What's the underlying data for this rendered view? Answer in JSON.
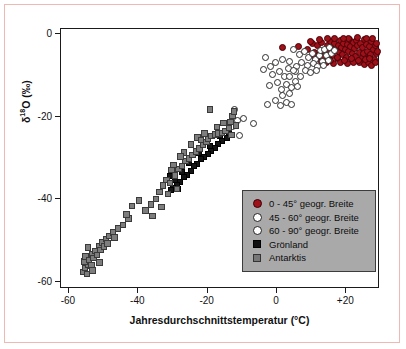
{
  "chart_data": {
    "type": "scatter",
    "title": "",
    "xlabel": "Jahresdurchschnittstemperatur (°C)",
    "ylabel": "δ¹⁸O (‰)",
    "xlim": [
      -62,
      30
    ],
    "ylim": [
      -62,
      1
    ],
    "xticks": [
      -60,
      -40,
      -20,
      0,
      20
    ],
    "xticklabels": [
      "-60",
      "-40",
      "-20",
      "0",
      "+20"
    ],
    "yticks": [
      0,
      -20,
      -40,
      -60
    ],
    "yticklabels": [
      "0",
      "-20",
      "-40",
      "-60"
    ],
    "grid": false,
    "legend_position": "lower-right-inside",
    "series": [
      {
        "name": "0 - 45° geogr. Breite",
        "marker": "filled-circle",
        "color": "#9e1119",
        "points": [
          [
            2.0,
            -3.4
          ],
          [
            6.5,
            -3.2
          ],
          [
            9.0,
            -4.0
          ],
          [
            10.5,
            -2.6
          ],
          [
            11.2,
            -4.6
          ],
          [
            12.0,
            -3.0
          ],
          [
            12.6,
            -5.2
          ],
          [
            13.2,
            -2.2
          ],
          [
            13.8,
            -4.2
          ],
          [
            14.2,
            -6.0
          ],
          [
            14.8,
            -3.0
          ],
          [
            15.2,
            -4.8
          ],
          [
            15.6,
            -2.0
          ],
          [
            16.0,
            -3.8
          ],
          [
            16.4,
            -5.4
          ],
          [
            16.8,
            -2.6
          ],
          [
            17.2,
            -4.2
          ],
          [
            17.6,
            -6.2
          ],
          [
            18.0,
            -3.0
          ],
          [
            18.3,
            -4.8
          ],
          [
            18.6,
            -1.8
          ],
          [
            19.0,
            -3.4
          ],
          [
            19.3,
            -5.2
          ],
          [
            19.6,
            -2.4
          ],
          [
            20.0,
            -4.0
          ],
          [
            20.3,
            -6.0
          ],
          [
            20.6,
            -2.8
          ],
          [
            21.0,
            -4.4
          ],
          [
            21.3,
            -1.6
          ],
          [
            21.6,
            -3.2
          ],
          [
            22.0,
            -5.0
          ],
          [
            22.3,
            -2.2
          ],
          [
            22.6,
            -3.8
          ],
          [
            23.0,
            -5.6
          ],
          [
            23.3,
            -1.8
          ],
          [
            23.6,
            -3.0
          ],
          [
            24.0,
            -4.6
          ],
          [
            24.3,
            -2.4
          ],
          [
            24.6,
            -6.2
          ],
          [
            25.0,
            -3.4
          ],
          [
            25.3,
            -5.0
          ],
          [
            25.6,
            -1.6
          ],
          [
            26.0,
            -2.8
          ],
          [
            26.3,
            -4.4
          ],
          [
            26.6,
            -6.0
          ],
          [
            27.0,
            -3.2
          ],
          [
            27.3,
            -5.2
          ],
          [
            27.6,
            -2.0
          ],
          [
            28.0,
            -4.0
          ],
          [
            28.3,
            -6.4
          ],
          [
            28.6,
            -3.0
          ],
          [
            28.9,
            -5.0
          ],
          [
            24.0,
            -7.2
          ],
          [
            25.5,
            -7.6
          ],
          [
            26.8,
            -7.0
          ],
          [
            27.5,
            -7.8
          ],
          [
            22.5,
            -7.0
          ],
          [
            20.5,
            -7.4
          ],
          [
            18.5,
            -7.2
          ],
          [
            16.5,
            -7.4
          ],
          [
            14.5,
            -7.0
          ],
          [
            13.0,
            -6.8
          ],
          [
            11.5,
            -6.4
          ],
          [
            21.0,
            -1.2
          ],
          [
            23.5,
            -1.0
          ],
          [
            26.0,
            -1.2
          ],
          [
            27.8,
            -1.4
          ],
          [
            19.5,
            -1.2
          ],
          [
            17.0,
            -1.4
          ],
          [
            15.0,
            -1.2
          ],
          [
            12.5,
            -1.6
          ],
          [
            29.2,
            -4.4
          ],
          [
            29.0,
            -2.4
          ],
          [
            28.8,
            -7.0
          ],
          [
            10.0,
            -2.0
          ],
          [
            11.0,
            -5.6
          ],
          [
            13.5,
            -5.8
          ],
          [
            15.8,
            -6.6
          ],
          [
            17.8,
            -5.8
          ],
          [
            19.8,
            -6.6
          ],
          [
            21.8,
            -6.2
          ],
          [
            23.8,
            -6.6
          ],
          [
            25.8,
            -6.4
          ],
          [
            27.0,
            -6.2
          ]
        ]
      },
      {
        "name": "45 - 60° geogr. Breite",
        "marker": "open-circle",
        "color": "#ffffff",
        "points": [
          [
            5.0,
            -4.0
          ],
          [
            6.8,
            -5.2
          ],
          [
            8.2,
            -4.4
          ],
          [
            9.5,
            -6.0
          ],
          [
            10.5,
            -5.0
          ],
          [
            11.5,
            -6.4
          ],
          [
            12.5,
            -5.4
          ],
          [
            13.5,
            -6.8
          ],
          [
            7.5,
            -7.0
          ],
          [
            9.0,
            -7.8
          ],
          [
            10.8,
            -7.4
          ],
          [
            12.0,
            -8.2
          ],
          [
            13.8,
            -7.8
          ],
          [
            8.5,
            -9.0
          ],
          [
            10.0,
            -9.6
          ],
          [
            11.8,
            -9.0
          ],
          [
            6.0,
            -8.2
          ],
          [
            14.5,
            -5.4
          ],
          [
            15.2,
            -6.6
          ],
          [
            16.0,
            -5.0
          ],
          [
            4.0,
            -6.8
          ],
          [
            5.5,
            -9.4
          ],
          [
            7.0,
            -10.4
          ],
          [
            12.8,
            -4.2
          ],
          [
            14.0,
            -4.0
          ],
          [
            15.5,
            -3.6
          ],
          [
            16.8,
            -4.2
          ]
        ]
      },
      {
        "name": "60 - 90° geogr. Breite",
        "marker": "open-circle",
        "color": "#ffffff",
        "points": [
          [
            -3.0,
            -6.0
          ],
          [
            -1.5,
            -8.0
          ],
          [
            0.0,
            -7.0
          ],
          [
            1.0,
            -9.2
          ],
          [
            2.0,
            -6.4
          ],
          [
            2.5,
            -10.6
          ],
          [
            3.5,
            -8.6
          ],
          [
            -2.0,
            -12.6
          ],
          [
            0.5,
            -12.0
          ],
          [
            1.5,
            -13.6
          ],
          [
            3.0,
            -12.4
          ],
          [
            4.5,
            -13.2
          ],
          [
            2.0,
            -15.0
          ],
          [
            3.8,
            -14.6
          ],
          [
            -2.5,
            -17.2
          ],
          [
            0.0,
            -16.4
          ],
          [
            1.2,
            -17.6
          ],
          [
            3.0,
            -16.8
          ],
          [
            4.6,
            -17.4
          ],
          [
            5.5,
            -11.6
          ],
          [
            6.2,
            -13.0
          ],
          [
            -1.0,
            -10.0
          ],
          [
            -3.5,
            -8.8
          ],
          [
            4.0,
            -10.4
          ],
          [
            5.0,
            -9.0
          ],
          [
            -9.5,
            -20.6
          ],
          [
            -10.5,
            -24.8
          ],
          [
            -12.0,
            -18.4
          ],
          [
            -6.5,
            -22.0
          ],
          [
            -12.5,
            -22.6
          ],
          [
            -11.0,
            -21.2
          ]
        ]
      },
      {
        "name": "Grönland",
        "marker": "filled-square",
        "color": "#141414",
        "points": [
          [
            -14.0,
            -25.6
          ],
          [
            -15.5,
            -26.2
          ],
          [
            -16.5,
            -27.0
          ],
          [
            -17.5,
            -28.0
          ],
          [
            -18.5,
            -28.6
          ],
          [
            -19.5,
            -29.4
          ],
          [
            -20.5,
            -30.2
          ],
          [
            -21.5,
            -30.6
          ],
          [
            -22.5,
            -31.8
          ],
          [
            -23.5,
            -32.4
          ],
          [
            -24.5,
            -33.6
          ],
          [
            -25.5,
            -34.4
          ],
          [
            -26.5,
            -35.0
          ],
          [
            -27.5,
            -36.2
          ],
          [
            -28.5,
            -36.8
          ],
          [
            -29.5,
            -37.6
          ],
          [
            -30.5,
            -34.8
          ],
          [
            -29.0,
            -35.6
          ],
          [
            -27.0,
            -33.8
          ],
          [
            -25.0,
            -31.6
          ],
          [
            -22.0,
            -29.2
          ],
          [
            -19.0,
            -27.4
          ],
          [
            -16.0,
            -25.0
          ],
          [
            -13.5,
            -24.4
          ],
          [
            -30.0,
            -38.2
          ],
          [
            -28.0,
            -38.0
          ]
        ]
      },
      {
        "name": "Antarktis",
        "marker": "filled-square-gray",
        "color": "#7d7d7d",
        "points": [
          [
            -55.5,
            -58.0
          ],
          [
            -55.0,
            -57.0
          ],
          [
            -54.5,
            -58.4
          ],
          [
            -54.0,
            -56.2
          ],
          [
            -55.2,
            -55.4
          ],
          [
            -54.8,
            -54.2
          ],
          [
            -53.8,
            -55.0
          ],
          [
            -53.2,
            -56.4
          ],
          [
            -53.0,
            -53.6
          ],
          [
            -52.5,
            -54.6
          ],
          [
            -52.0,
            -52.8
          ],
          [
            -51.5,
            -53.8
          ],
          [
            -51.0,
            -51.6
          ],
          [
            -50.5,
            -52.6
          ],
          [
            -50.0,
            -50.8
          ],
          [
            -49.5,
            -51.8
          ],
          [
            -49.0,
            -50.0
          ],
          [
            -48.5,
            -51.0
          ],
          [
            -48.0,
            -49.2
          ],
          [
            -47.0,
            -48.4
          ],
          [
            -45.5,
            -47.4
          ],
          [
            -44.0,
            -46.6
          ],
          [
            -42.5,
            -45.0
          ],
          [
            -41.5,
            -42.0
          ],
          [
            -39.5,
            -40.6
          ],
          [
            -37.5,
            -43.0
          ],
          [
            -36.0,
            -41.6
          ],
          [
            -34.5,
            -40.2
          ],
          [
            -33.5,
            -38.6
          ],
          [
            -32.5,
            -37.0
          ],
          [
            -31.5,
            -35.6
          ],
          [
            -30.5,
            -36.4
          ],
          [
            -30.0,
            -33.2
          ],
          [
            -29.0,
            -34.6
          ],
          [
            -28.5,
            -37.8
          ],
          [
            -28.0,
            -33.0
          ],
          [
            -27.0,
            -32.2
          ],
          [
            -26.0,
            -31.0
          ],
          [
            -25.0,
            -30.4
          ],
          [
            -24.0,
            -29.6
          ],
          [
            -23.0,
            -28.8
          ],
          [
            -22.0,
            -28.0
          ],
          [
            -21.0,
            -27.2
          ],
          [
            -20.0,
            -26.4
          ],
          [
            -19.5,
            -25.6
          ],
          [
            -19.0,
            -18.6
          ],
          [
            -18.5,
            -25.0
          ],
          [
            -17.5,
            -24.6
          ],
          [
            -16.5,
            -24.4
          ],
          [
            -15.5,
            -24.2
          ],
          [
            -14.5,
            -23.8
          ],
          [
            -13.5,
            -23.0
          ],
          [
            -13.0,
            -21.6
          ],
          [
            -12.5,
            -20.2
          ],
          [
            -12.0,
            -19.0
          ],
          [
            -11.5,
            -22.4
          ],
          [
            -12.8,
            -24.8
          ],
          [
            -20.5,
            -24.4
          ],
          [
            -22.5,
            -25.4
          ],
          [
            -24.5,
            -27.0
          ],
          [
            -26.5,
            -29.0
          ],
          [
            -31.0,
            -39.0
          ],
          [
            -33.0,
            -42.2
          ],
          [
            -35.5,
            -44.4
          ],
          [
            -43.0,
            -44.0
          ],
          [
            -46.5,
            -49.6
          ],
          [
            -52.8,
            -57.6
          ],
          [
            -54.2,
            -52.0
          ],
          [
            -50.8,
            -55.6
          ],
          [
            -29.5,
            -32.0
          ],
          [
            -27.5,
            -30.0
          ],
          [
            -21.5,
            -26.0
          ],
          [
            -17.0,
            -22.8
          ],
          [
            -15.0,
            -21.8
          ]
        ]
      }
    ]
  },
  "legend": {
    "items": [
      {
        "label": "0 - 45° geogr. Breite",
        "marker": "red"
      },
      {
        "label": "45 - 60° geogr. Breite",
        "marker": "open"
      },
      {
        "label": "60 - 90° geogr. Breite",
        "marker": "open"
      },
      {
        "label": "Grönland",
        "marker": "black"
      },
      {
        "label": "Antarktis",
        "marker": "gray"
      }
    ]
  },
  "axes": {
    "ylabel_main": "δ",
    "ylabel_sup": "18",
    "ylabel_rest": "O (‰)"
  }
}
